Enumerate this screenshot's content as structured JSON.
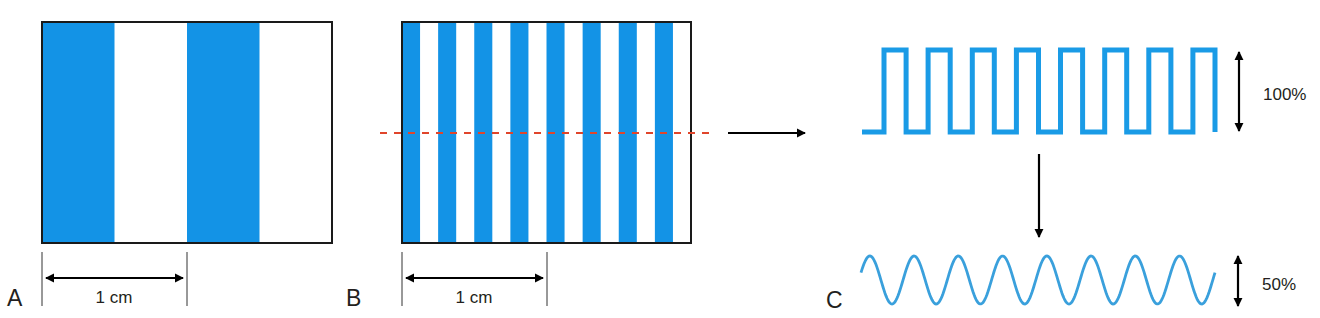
{
  "figure": {
    "colors": {
      "stripe_blue": "#1393e6",
      "wave_blue": "#1a9be6",
      "sine_blue": "#3aa0dc",
      "outline": "#1a1a1a",
      "dashed_line_red": "#e0452b",
      "arrow": "#000000",
      "text": "#231f20"
    },
    "panels": {
      "a": {
        "label": "A",
        "stripe_pairs": 2,
        "scale_label": "1 cm"
      },
      "b": {
        "label": "B",
        "stripe_pairs": 8,
        "scale_label": "1 cm",
        "scan_line": "dashed"
      },
      "c": {
        "label": "C",
        "square_wave": {
          "cycles": 8,
          "amplitude_label": "100%"
        },
        "sine_wave": {
          "cycles": 8,
          "amplitude_label": "50%"
        }
      }
    }
  }
}
